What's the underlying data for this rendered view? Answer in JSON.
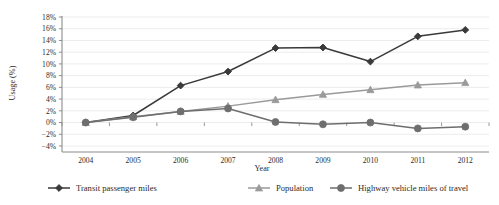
{
  "chart_data": {
    "type": "line",
    "title": "",
    "subtitle": "",
    "xlabel": "Year",
    "ylabel": "Usage (%)",
    "categories": [
      "2004",
      "2005",
      "2006",
      "2007",
      "2008",
      "2009",
      "2010",
      "2011",
      "2012"
    ],
    "x": [
      2004,
      2005,
      2006,
      2007,
      2008,
      2009,
      2010,
      2011,
      2012
    ],
    "ylim": [
      -4,
      18
    ],
    "ytick_labels": [
      "18%",
      "16%",
      "14%",
      "12%",
      "10%",
      "8%",
      "6%",
      "4%",
      "2%",
      "0%",
      "-2%",
      "-4%"
    ],
    "ytick_values": [
      18,
      16,
      14,
      12,
      10,
      8,
      6,
      4,
      2,
      0,
      -2,
      -4
    ],
    "ytick_step": 2,
    "grid": "horizontal",
    "legend_position": "bottom",
    "series": [
      {
        "name": "Transit passenger miles",
        "marker": "diamond",
        "color": "#3a3a3a",
        "values": [
          0.0,
          1.2,
          6.3,
          8.7,
          12.7,
          12.8,
          10.4,
          14.7,
          15.8
        ]
      },
      {
        "name": "Population",
        "marker": "triangle",
        "color": "#9a9a9a",
        "values": [
          0.0,
          1.0,
          1.9,
          2.8,
          3.9,
          4.8,
          5.6,
          6.4,
          6.8
        ]
      },
      {
        "name": "Highway vehicle miles of travel",
        "marker": "circle",
        "color": "#6e6e6e",
        "values": [
          0.0,
          0.9,
          1.9,
          2.4,
          0.1,
          -0.3,
          0.0,
          -1.0,
          -0.7
        ]
      }
    ]
  },
  "legend": {
    "items": [
      {
        "label": "Transit passenger miles"
      },
      {
        "label": "Population"
      },
      {
        "label": "Highway vehicle miles of travel"
      }
    ]
  },
  "axes": {
    "y_title": "Usage (%)",
    "x_title": "Year"
  },
  "colors": {
    "series_1": "#3a3a3a",
    "series_2": "#9a9a9a",
    "series_3": "#6e6e6e",
    "grid": "#ececec",
    "axis": "#8c8c8c",
    "background": "#ffffff"
  }
}
